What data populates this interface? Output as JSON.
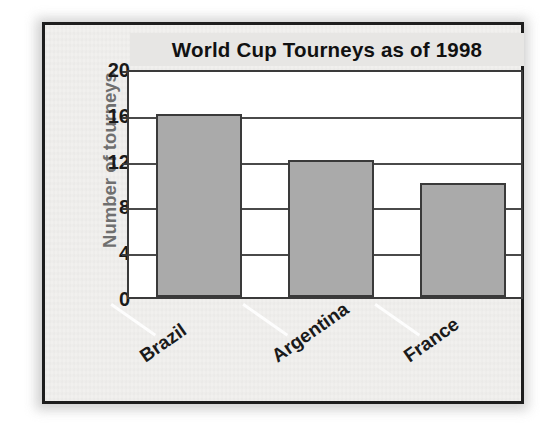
{
  "figure": {
    "frame_color": "#1d1d1d",
    "paper_color": "#f1f0ee"
  },
  "chart_data": {
    "type": "bar",
    "title": "World Cup Tourneys as of 1998",
    "xlabel": "",
    "ylabel": "Number of tourneys",
    "categories": [
      "Brazil",
      "Argentina",
      "France"
    ],
    "values": [
      16,
      12,
      10
    ],
    "ylim": [
      0,
      20
    ],
    "yticks": [
      0,
      4,
      8,
      12,
      16,
      20
    ],
    "ytick_labels": [
      "0",
      "4",
      "8",
      "12",
      "16",
      "20"
    ],
    "grid": true,
    "legend": "none",
    "bar_fill_color": "#aaaaaa",
    "bar_edge_color": "#3a3a3a",
    "title_color": "#111111",
    "ylabel_color": "#6f6f6f",
    "tick_label_color": "#1a1a1a"
  }
}
